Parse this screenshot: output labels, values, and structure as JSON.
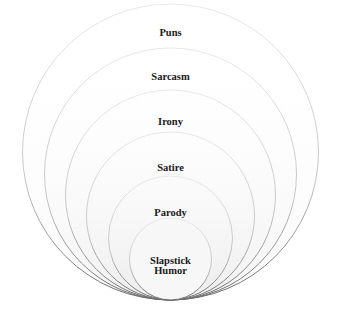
{
  "diagram": {
    "type": "nested-circles",
    "stroke_color": "#b8b8b8",
    "levels": [
      {
        "label": "Puns"
      },
      {
        "label": "Sarcasm"
      },
      {
        "label": "Irony"
      },
      {
        "label": "Satire"
      },
      {
        "label": "Parody"
      },
      {
        "label": "Slapstick Humor",
        "lines": [
          "Slapstick",
          "Humor"
        ]
      }
    ]
  }
}
